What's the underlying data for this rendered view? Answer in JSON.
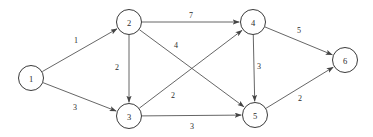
{
  "figure": {
    "background_color": "#ffffff",
    "node_stroke_color": "#3a3a3a",
    "edge_stroke_color": "#555555",
    "text_color": "#2b2b2b",
    "node_radius": 12.5,
    "width": 373,
    "height": 137
  },
  "chart_data": {
    "type": "diagram",
    "diagram_kind": "directed-weighted-graph",
    "title": "",
    "nodes": [
      {
        "id": "1",
        "label": "1",
        "x": 31,
        "y": 78
      },
      {
        "id": "2",
        "label": "2",
        "x": 129,
        "y": 22
      },
      {
        "id": "3",
        "label": "3",
        "x": 129,
        "y": 116
      },
      {
        "id": "4",
        "label": "4",
        "x": 253,
        "y": 22
      },
      {
        "id": "5",
        "label": "5",
        "x": 255,
        "y": 115
      },
      {
        "id": "6",
        "label": "6",
        "x": 345,
        "y": 60
      }
    ],
    "edges": [
      {
        "from": "1",
        "to": "2",
        "weight": "1",
        "label_x": 76,
        "label_y": 40
      },
      {
        "from": "1",
        "to": "3",
        "weight": "3",
        "label_x": 75,
        "label_y": 107
      },
      {
        "from": "2",
        "to": "3",
        "weight": "2",
        "label_x": 117,
        "label_y": 67
      },
      {
        "from": "2",
        "to": "4",
        "weight": "7",
        "label_x": 191,
        "label_y": 15
      },
      {
        "from": "2",
        "to": "5",
        "weight": "4",
        "label_x": 176,
        "label_y": 45
      },
      {
        "from": "3",
        "to": "4",
        "weight": "2",
        "label_x": 173,
        "label_y": 95
      },
      {
        "from": "3",
        "to": "5",
        "weight": "3",
        "label_x": 192,
        "label_y": 126
      },
      {
        "from": "4",
        "to": "5",
        "weight": "3",
        "label_x": 259,
        "label_y": 66
      },
      {
        "from": "4",
        "to": "6",
        "weight": "5",
        "label_x": 299,
        "label_y": 30
      },
      {
        "from": "5",
        "to": "6",
        "weight": "2",
        "label_x": 300,
        "label_y": 98
      }
    ]
  }
}
